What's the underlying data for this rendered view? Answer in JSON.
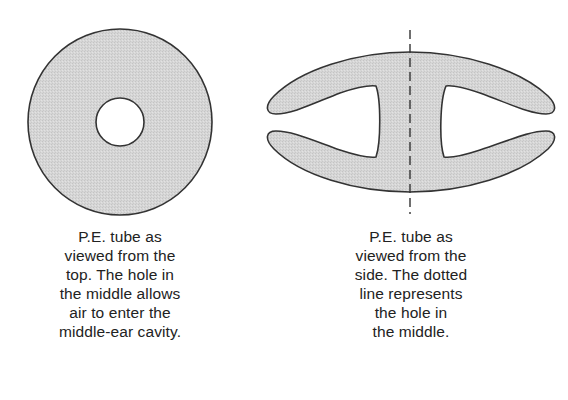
{
  "figure": {
    "colors": {
      "fill": "#d4d4d4",
      "stroke": "#333333",
      "hole": "#ffffff",
      "text": "#222222",
      "background": "#ffffff"
    },
    "top_view": {
      "label": "P.E. tube top view",
      "caption_lines": [
        "P.E. tube as",
        "viewed from the",
        "top. The hole in",
        "the middle allows",
        "air to enter the",
        "middle-ear cavity."
      ]
    },
    "side_view": {
      "label": "P.E. tube side view",
      "caption_lines": [
        "P.E. tube as",
        "viewed from the",
        "side. The dotted",
        "line represents",
        "the hole in",
        "the middle."
      ]
    }
  }
}
